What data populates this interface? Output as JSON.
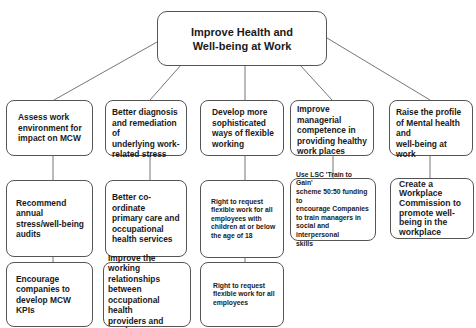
{
  "root": {
    "title": "Improve Health and\nWell-being at Work"
  },
  "columns": [
    {
      "nodes": [
        "Assess work\nenvironment for\nimpact on MCW",
        "Recommend annual\nstress/well-being\naudits",
        "Encourage\ncompanies to\ndevelop MCW KPIs"
      ]
    },
    {
      "nodes": [
        "Better diagnosis\nand remediation of\nunderlying work-\nrelated stress",
        "Better co-ordinate\nprimary care and\noccupational\nhealth services",
        "Improve the working\nrelationships\nbetween\noccupational health\nproviders and\nemployers"
      ]
    },
    {
      "nodes": [
        "Develop more\nsophisticated\nways of flexible\nworking",
        "Right to request\nflexible work for all\nemployees with\nchildren at or below\nthe age of 18",
        "Right to request\nflexible work for all\nemployees"
      ]
    },
    {
      "nodes": [
        "Improve\nmanagerial\ncompetence in\nproviding healthy\nwork places",
        "Use LSC  'Train to Gain'\nscheme 50:50 funding to\nencourage Companies\nto train managers in\nsocial and interpersonal\nskills"
      ]
    },
    {
      "nodes": [
        "Raise the profile\nof Mental health and\nwell-being at work",
        "Create a\nWorkplace\nCommission to\npromote  well-\nbeing in the\nworkplace"
      ]
    }
  ],
  "colors": {
    "border": "#555555",
    "text": "#1a1a1a",
    "background": "#ffffff"
  }
}
